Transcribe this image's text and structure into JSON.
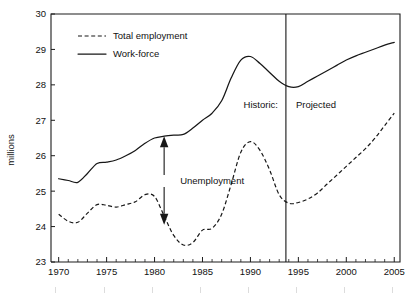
{
  "chart_data": {
    "type": "line",
    "title": "",
    "xlabel": "",
    "ylabel": "millions",
    "xlim": [
      1969.2,
      2005.6
    ],
    "ylim": [
      23,
      30
    ],
    "yticks": [
      23,
      24,
      25,
      26,
      27,
      28,
      29,
      30
    ],
    "ytick_labels": [
      "23",
      "24",
      "25",
      "26",
      "27",
      "28",
      "29",
      "30"
    ],
    "xticks": [
      1970,
      1975,
      1980,
      1985,
      1990,
      1995,
      2000,
      2005
    ],
    "xtick_labels": [
      "1970",
      "1975",
      "1980",
      "1985",
      "1990",
      "1995",
      "2000",
      "2005"
    ],
    "x_minor_step": 1,
    "grid": false,
    "legend_position": "top-left-inside",
    "series": [
      {
        "name": "Total employment",
        "style": "dashed",
        "x": [
          1970,
          1971,
          1972,
          1973,
          1974,
          1975,
          1976,
          1977,
          1978,
          1979,
          1980,
          1981,
          1982,
          1983,
          1984,
          1985,
          1986,
          1987,
          1988,
          1989,
          1990,
          1991,
          1992,
          1993,
          1994,
          1995,
          1996,
          1997,
          1998,
          1999,
          2000,
          2001,
          2002,
          2003,
          2004,
          2005
        ],
        "values": [
          24.35,
          24.15,
          24.12,
          24.38,
          24.62,
          24.6,
          24.55,
          24.62,
          24.7,
          24.9,
          24.85,
          24.3,
          23.75,
          23.48,
          23.55,
          23.9,
          23.95,
          24.35,
          25.2,
          26.1,
          26.4,
          26.15,
          25.6,
          24.9,
          24.66,
          24.68,
          24.78,
          24.95,
          25.2,
          25.45,
          25.7,
          25.95,
          26.2,
          26.5,
          26.85,
          27.2
        ]
      },
      {
        "name": "Work-force",
        "style": "solid",
        "x": [
          1970,
          1971,
          1972,
          1973,
          1974,
          1975,
          1976,
          1977,
          1978,
          1979,
          1980,
          1981,
          1982,
          1983,
          1984,
          1985,
          1986,
          1987,
          1988,
          1989,
          1990,
          1991,
          1992,
          1993,
          1994,
          1995,
          1996,
          1997,
          1998,
          1999,
          2000,
          2001,
          2002,
          2003,
          2004,
          2005
        ],
        "values": [
          25.35,
          25.3,
          25.25,
          25.5,
          25.78,
          25.82,
          25.88,
          26.0,
          26.15,
          26.35,
          26.5,
          26.55,
          26.58,
          26.6,
          26.78,
          27.0,
          27.2,
          27.55,
          28.2,
          28.7,
          28.8,
          28.6,
          28.35,
          28.1,
          27.95,
          27.95,
          28.1,
          28.25,
          28.4,
          28.55,
          28.7,
          28.82,
          28.92,
          29.02,
          29.12,
          29.2
        ]
      }
    ],
    "divider": {
      "x": 1993.7,
      "left_label": "Historic:",
      "right_label": "Projected"
    },
    "annotations": [
      {
        "name": "unemployment-gap",
        "label": "Unemployment",
        "x": 1981,
        "y_top": 26.55,
        "y_bottom": 24.05
      }
    ],
    "legend": [
      {
        "label": "Total employment",
        "style": "dashed"
      },
      {
        "label": "Work-force",
        "style": "solid"
      }
    ]
  }
}
